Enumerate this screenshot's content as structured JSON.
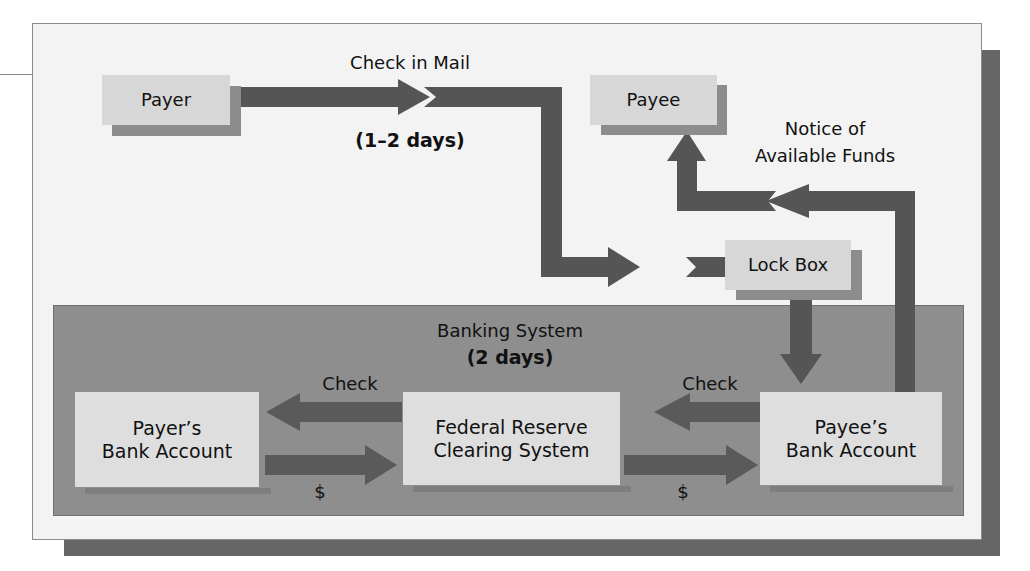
{
  "diagram": {
    "title_implicit": "Lock box collection process",
    "colors": {
      "arrow": "#555555",
      "panel": "#f3f3f3",
      "panel_shadow": "#666666",
      "banking_system": "#8e8e8e",
      "node_box": "#d7d7d7",
      "node_shadow": "#8c8c8c"
    },
    "nodes": {
      "payer": "Payer",
      "payee": "Payee",
      "lock_box": "Lock Box",
      "payers_bank_line1": "Payer’s",
      "payers_bank_line2": "Bank Account",
      "fed_line1": "Federal Reserve",
      "fed_line2": "Clearing System",
      "payees_bank_line1": "Payee’s",
      "payees_bank_line2": "Bank Account"
    },
    "labels": {
      "check_in_mail": "Check in Mail",
      "mail_time": "(1–2 days)",
      "notice_line1": "Notice of",
      "notice_line2": "Available Funds",
      "banking_system": "Banking System",
      "banking_time": "(2 days)",
      "check_left": "Check",
      "check_right": "Check",
      "dollar_left": "$",
      "dollar_right": "$"
    },
    "edges": [
      {
        "from": "Payer",
        "to": "Lock Box",
        "label": "Check in Mail (1–2 days)"
      },
      {
        "from": "Lock Box",
        "to": "Payee’s Bank Account",
        "label": ""
      },
      {
        "from": "Payee’s Bank Account",
        "to": "Payee",
        "label": "Notice of Available Funds"
      },
      {
        "from": "Payee’s Bank Account",
        "to": "Federal Reserve Clearing System",
        "label": "Check"
      },
      {
        "from": "Federal Reserve Clearing System",
        "to": "Payer’s Bank Account",
        "label": "Check"
      },
      {
        "from": "Payer’s Bank Account",
        "to": "Federal Reserve Clearing System",
        "label": "$"
      },
      {
        "from": "Federal Reserve Clearing System",
        "to": "Payee’s Bank Account",
        "label": "$"
      }
    ]
  }
}
